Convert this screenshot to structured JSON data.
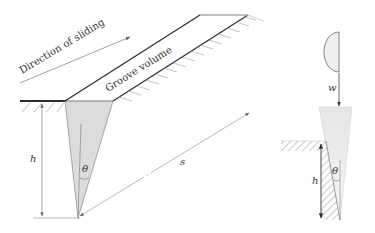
{
  "figure": {
    "labels": {
      "direction": "Direction of sliding",
      "groove": "Groove volume",
      "h_left": "h",
      "theta_left": "θ",
      "s": "s",
      "w": "w",
      "h_right": "h",
      "theta_right": "θ"
    },
    "colors": {
      "ink": "#333333",
      "line_dark": "#2a2a2a",
      "line_light": "#9a9a9a",
      "groove_fill": "#dcdcdc",
      "hatch": "#8a8a8a",
      "surface": "#333333"
    }
  }
}
